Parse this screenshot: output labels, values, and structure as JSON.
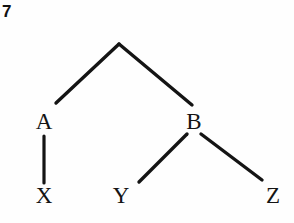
{
  "figure": {
    "number": "7",
    "background_color": "#fefefe",
    "ink_color": "#141414"
  },
  "diagram": {
    "type": "tree",
    "nodes": [
      {
        "id": "root",
        "label": "",
        "x": 119,
        "y": 44
      },
      {
        "id": "A",
        "label": "A",
        "x": 44,
        "y": 121
      },
      {
        "id": "B",
        "label": "B",
        "x": 194,
        "y": 121
      },
      {
        "id": "X",
        "label": "X",
        "x": 44,
        "y": 195
      },
      {
        "id": "Y",
        "label": "Y",
        "x": 121,
        "y": 195
      },
      {
        "id": "Z",
        "label": "Z",
        "x": 273,
        "y": 195
      }
    ],
    "edges": [
      {
        "from": "root",
        "to": "A",
        "x1": 119,
        "y1": 44,
        "x2": 56,
        "y2": 103
      },
      {
        "from": "root",
        "to": "B",
        "x1": 119,
        "y1": 44,
        "x2": 192,
        "y2": 105
      },
      {
        "from": "A",
        "to": "X",
        "x1": 44,
        "y1": 136,
        "x2": 44,
        "y2": 183
      },
      {
        "from": "B",
        "to": "Y",
        "x1": 187,
        "y1": 134,
        "x2": 139,
        "y2": 182
      },
      {
        "from": "B",
        "to": "Z",
        "x1": 201,
        "y1": 134,
        "x2": 262,
        "y2": 180
      }
    ],
    "line_width": 3
  }
}
